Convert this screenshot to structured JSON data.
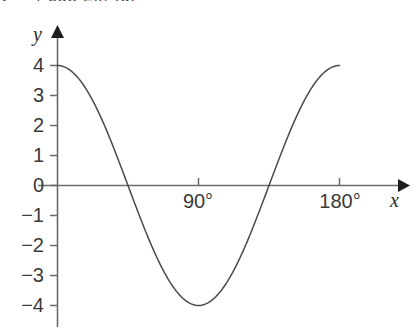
{
  "figure": {
    "background_color": "#ffffff",
    "width": 416,
    "height": 333,
    "partial_top_text": "y = 4 cos 2x, for"
  },
  "axes": {
    "x_axis_name": "x",
    "y_axis_name": "y",
    "axis_color": "#6b6b6b",
    "curve_color": "#4a4a4a",
    "x_ticks": [
      {
        "label": "90°",
        "value": 90
      },
      {
        "label": "180°",
        "value": 180
      }
    ],
    "y_ticks": [
      {
        "label": "4",
        "value": 4
      },
      {
        "label": "3",
        "value": 3
      },
      {
        "label": "2",
        "value": 2
      },
      {
        "label": "1",
        "value": 1
      },
      {
        "label": "0",
        "value": 0
      },
      {
        "label": "−1",
        "value": -1
      },
      {
        "label": "−2",
        "value": -2
      },
      {
        "label": "−3",
        "value": -3
      },
      {
        "label": "−4",
        "value": -4
      }
    ]
  },
  "chart_data": {
    "type": "line",
    "title": "",
    "subtitle": "",
    "xlabel": "x",
    "ylabel": "y",
    "xlim": [
      0,
      180
    ],
    "ylim": [
      -4,
      4
    ],
    "grid": false,
    "legend": false,
    "legend_position": "none",
    "x_tick_labels": [
      "90°",
      "180°"
    ],
    "x_tick_values": [
      90,
      180
    ],
    "y_tick_labels": [
      "4",
      "3",
      "2",
      "1",
      "0",
      "−1",
      "−2",
      "−3",
      "−4"
    ],
    "y_tick_values": [
      4,
      3,
      2,
      1,
      0,
      -1,
      -2,
      -3,
      -4
    ],
    "series": [
      {
        "name": "y = 4 cos 2x",
        "amplitude": 4,
        "period_degrees": 180,
        "x": [
          0,
          10,
          20,
          30,
          40,
          45,
          50,
          60,
          70,
          80,
          90,
          100,
          110,
          120,
          130,
          135,
          140,
          150,
          160,
          170,
          180
        ],
        "values": [
          4.0,
          3.53,
          2.3,
          0.59,
          -1.37,
          -2.83,
          -3.06,
          -3.86,
          -3.86,
          -3.06,
          -4.0,
          -3.06,
          -1.37,
          0.59,
          2.3,
          2.83,
          3.53,
          3.46,
          3.86,
          3.94,
          4.0
        ],
        "key_points": {
          "start": {
            "x": 0,
            "y": 4
          },
          "first_zero": {
            "x": 45,
            "y": 0
          },
          "minimum": {
            "x": 90,
            "y": -4
          },
          "second_zero": {
            "x": 135,
            "y": 0
          },
          "end": {
            "x": 180,
            "y": 4
          }
        }
      }
    ]
  }
}
